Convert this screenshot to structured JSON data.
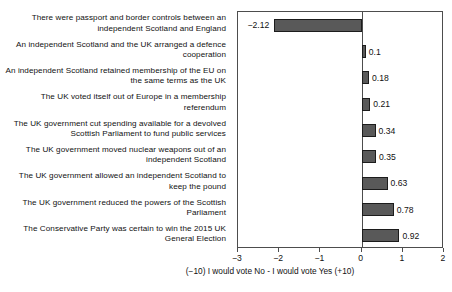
{
  "chart_data": {
    "type": "bar",
    "orientation": "horizontal",
    "title": "",
    "xlabel": "(−10) I would vote No - I would vote Yes (+10)",
    "ylabel": "",
    "xlim": [
      -3,
      2
    ],
    "xticks": [
      -3,
      -2,
      -1,
      0,
      1,
      2
    ],
    "xtick_labels": [
      "−3",
      "−2",
      "−1",
      "0",
      "1",
      "2"
    ],
    "grid": false,
    "legend": false,
    "bar_color": "#595959",
    "bar_edge_color": "#1c1c1c",
    "axis_color": "#4d4d4d",
    "categories": [
      "There were passport and border controls between an independent Scotland and England",
      "An independent Scotland and the UK arranged a defence cooperation",
      "An independent Scotland retained membership of the EU on the same terms as the UK",
      "The UK voted itself out of Europe in a membership referendum",
      "The UK government cut spending available for a devolved Scottish Parliament to fund public services",
      "The UK government moved nuclear weapons out of an independent Scotland",
      "The UK government allowed an independent Scotland to keep the pound",
      "The UK government reduced the powers of the Scottish Parliament",
      "The Conservative Party was certain to win the 2015 UK General Election"
    ],
    "values": [
      -2.12,
      0.1,
      0.18,
      0.21,
      0.34,
      0.35,
      0.63,
      0.78,
      0.92
    ],
    "value_labels": [
      "−2.12",
      "0.1",
      "0.18",
      "0.21",
      "0.34",
      "0.35",
      "0.63",
      "0.78",
      "0.92"
    ]
  }
}
